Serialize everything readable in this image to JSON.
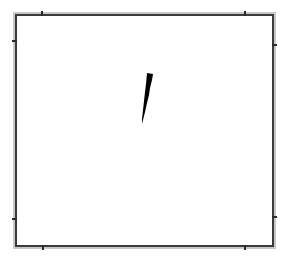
{
  "canvas": {
    "background": "#ffffff",
    "width": 286,
    "height": 261
  },
  "frame": {
    "style": "double-line border",
    "outer_color": "#c8c8c8",
    "inner_color": "#3a3a3a",
    "notches": [
      {
        "edge": "top",
        "x": 41
      },
      {
        "edge": "top",
        "x": 244
      },
      {
        "edge": "left",
        "y": 40
      },
      {
        "edge": "left",
        "y": 218
      },
      {
        "edge": "right",
        "y": 44
      },
      {
        "edge": "right",
        "y": 216
      },
      {
        "edge": "bottom",
        "x": 42
      },
      {
        "edge": "bottom",
        "x": 244
      }
    ]
  },
  "drawing": {
    "shape": "brush-stroke",
    "color": "#000000",
    "description": "single tapered black brush stroke, slanted, near center"
  }
}
